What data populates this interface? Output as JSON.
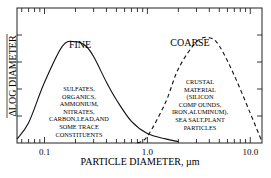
{
  "chart_data": {
    "type": "line",
    "title": "",
    "xlabel": "PARTICLE DIAMETER, µm",
    "ylabel": "ΔLOG DIAMETER",
    "ylabel_note": "numerator of y-axis fraction clipped at left edge",
    "x_scale": "log",
    "xlim": [
      0.054,
      13
    ],
    "ylim": [
      0,
      1
    ],
    "x_tick_labels": [
      "0.1",
      "1.0",
      "10.0"
    ],
    "x_ticks": [
      0.1,
      1.0,
      10.0
    ],
    "y_tick_labels": [],
    "grid": false,
    "legend": "none",
    "series": [
      {
        "name": "FINE",
        "style": "solid",
        "x": [
          0.054,
          0.07,
          0.1,
          0.15,
          0.2,
          0.25,
          0.3,
          0.4,
          0.5,
          0.7,
          1.0,
          1.5,
          2.0
        ],
        "y": [
          0.03,
          0.15,
          0.45,
          0.72,
          0.75,
          0.72,
          0.64,
          0.45,
          0.32,
          0.16,
          0.07,
          0.03,
          0.01
        ]
      },
      {
        "name": "COARSE",
        "style": "dashed",
        "x": [
          0.8,
          1.0,
          1.5,
          2.0,
          3.0,
          4.0,
          5.0,
          7.0,
          10.0,
          13.0
        ],
        "y": [
          0.0,
          0.05,
          0.3,
          0.55,
          0.75,
          0.78,
          0.72,
          0.5,
          0.22,
          0.01
        ]
      }
    ],
    "annotations": [
      {
        "target": "FINE",
        "label": "FINE",
        "lines": [
          "SULFATES,",
          "ORGANICS,",
          "AMMONIUM,",
          "NITRATES,",
          "CARBON,LEAD,AND",
          "SOME TRACE",
          "CONSTITUENTS"
        ]
      },
      {
        "target": "COARSE",
        "label": "COARSE",
        "lines": [
          "CRUSTAL",
          "MATERIAL",
          "(SILICON",
          "COMP OUNDS,",
          "IRON,ALUMINUM),",
          "SEA SALT,PLANT",
          "PARTICLES"
        ]
      }
    ]
  }
}
